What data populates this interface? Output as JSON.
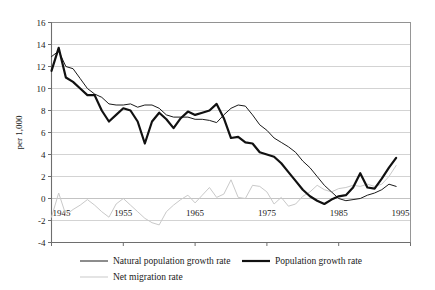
{
  "chart_data": {
    "type": "line",
    "title": "",
    "xlabel": "",
    "ylabel": "per 1,000",
    "xlim": [
      1945,
      1995
    ],
    "ylim": [
      -4,
      16
    ],
    "xticks": [
      1945,
      1955,
      1965,
      1975,
      1985,
      1995
    ],
    "xtick_labels": [
      "1945",
      "1955",
      "1965",
      "1975",
      "1985",
      "1995"
    ],
    "yticks": [
      -4,
      -2,
      0,
      2,
      4,
      6,
      8,
      10,
      12,
      14,
      16
    ],
    "ytick_labels": [
      "-4",
      "-2",
      "0",
      "2",
      "4",
      "6",
      "8",
      "10",
      "12",
      "14",
      "16"
    ],
    "grid": "horizontal",
    "legend_position": "bottom",
    "x": [
      1945,
      1946,
      1947,
      1948,
      1949,
      1950,
      1951,
      1952,
      1953,
      1954,
      1955,
      1956,
      1957,
      1958,
      1959,
      1960,
      1961,
      1962,
      1963,
      1964,
      1965,
      1966,
      1967,
      1968,
      1969,
      1970,
      1971,
      1972,
      1973,
      1974,
      1975,
      1976,
      1977,
      1978,
      1979,
      1980,
      1981,
      1982,
      1983,
      1984,
      1985,
      1986,
      1987,
      1988,
      1989,
      1990,
      1991,
      1992,
      1993
    ],
    "series": [
      {
        "name": "Natural population growth rate",
        "color": "#1a1a1a",
        "width": 1.0,
        "values": [
          12.9,
          13.4,
          12.0,
          11.8,
          10.9,
          10.0,
          9.5,
          9.2,
          8.6,
          8.5,
          8.5,
          8.6,
          8.3,
          8.5,
          8.5,
          8.2,
          7.6,
          7.4,
          7.4,
          7.4,
          7.2,
          7.2,
          7.1,
          6.9,
          7.6,
          8.2,
          8.5,
          8.4,
          7.6,
          6.7,
          6.2,
          5.5,
          5.1,
          4.7,
          4.2,
          3.4,
          2.8,
          2.0,
          1.2,
          0.6,
          0.0,
          -0.2,
          -0.1,
          0.0,
          0.3,
          0.5,
          0.8,
          1.3,
          1.1
        ]
      },
      {
        "name": "Population growth rate",
        "color": "#111111",
        "width": 2.2,
        "values": [
          11.6,
          13.7,
          11.0,
          10.6,
          10.0,
          9.4,
          9.4,
          8.0,
          7.0,
          7.6,
          8.2,
          8.0,
          7.0,
          5.0,
          7.0,
          7.8,
          7.2,
          6.4,
          7.3,
          7.9,
          7.6,
          7.8,
          8.0,
          8.6,
          7.3,
          5.5,
          5.6,
          5.1,
          5.0,
          4.2,
          4.0,
          3.8,
          3.2,
          2.4,
          1.6,
          0.8,
          0.2,
          -0.2,
          -0.5,
          -0.1,
          0.2,
          0.3,
          1.0,
          2.3,
          1.0,
          0.9,
          1.8,
          2.8,
          3.7
        ]
      },
      {
        "name": "Net migration rate",
        "color": "#c9c9c9",
        "width": 1.0,
        "values": [
          -1.7,
          0.5,
          -1.5,
          -1.0,
          -0.6,
          -0.1,
          -0.6,
          -1.2,
          -1.7,
          -0.5,
          0.0,
          -0.6,
          -1.2,
          -1.8,
          -2.2,
          -2.4,
          -1.2,
          -0.6,
          -0.1,
          0.3,
          -0.4,
          0.3,
          1.0,
          0.1,
          0.4,
          1.7,
          0.1,
          0.0,
          1.2,
          1.1,
          0.6,
          -0.5,
          0.1,
          -0.7,
          -0.5,
          0.2,
          0.6,
          1.2,
          0.8,
          0.6,
          0.9,
          1.0,
          1.2,
          1.1,
          1.3,
          1.1,
          1.3,
          2.0,
          3.0
        ]
      }
    ],
    "legend": [
      {
        "label": "Natural population growth rate",
        "color": "#1a1a1a",
        "width": 1.0
      },
      {
        "label": "Population growth rate",
        "color": "#111111",
        "width": 2.2
      },
      {
        "label": "Net migration rate",
        "color": "#c9c9c9",
        "width": 1.0
      }
    ]
  }
}
